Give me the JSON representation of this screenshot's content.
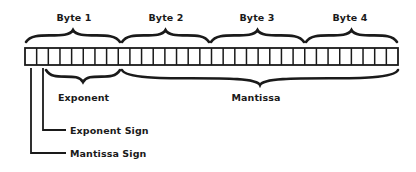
{
  "diagram": {
    "register": {
      "bit_count": 32,
      "x": 25,
      "y": 48,
      "width": 373,
      "height": 17,
      "stroke": "#1a1a1a"
    },
    "bytes": [
      {
        "label": "Byte 1",
        "x1": 25,
        "x2": 121,
        "label_x": 74
      },
      {
        "label": "Byte 2",
        "x1": 121,
        "x2": 210,
        "label_x": 166
      },
      {
        "label": "Byte 3",
        "x1": 210,
        "x2": 305,
        "label_x": 257
      },
      {
        "label": "Byte 4",
        "x1": 305,
        "x2": 398,
        "label_x": 350
      }
    ],
    "fields": {
      "exponent": {
        "label": "Exponent",
        "x1": 46,
        "x2": 121,
        "label_x": 58,
        "label_y": 92
      },
      "mantissa": {
        "label": "Mantissa",
        "x1": 121,
        "x2": 398,
        "label_x": 256,
        "label_y": 92
      }
    },
    "leaders": {
      "exponent_sign": {
        "label": "Exponent Sign",
        "x": 43,
        "y_bottom": 130,
        "x_end": 66,
        "label_x": 70,
        "label_y": 125
      },
      "mantissa_sign": {
        "label": "Mantissa Sign",
        "x": 31,
        "y_bottom": 153,
        "x_end": 66,
        "label_x": 70,
        "label_y": 148
      }
    },
    "colors": {
      "ink": "#1a1a1a",
      "background": "#ffffff"
    }
  }
}
